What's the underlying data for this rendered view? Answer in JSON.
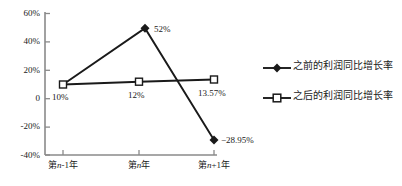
{
  "chart_data": {
    "type": "line",
    "title": "",
    "subtitle": "",
    "xlabel": "",
    "ylabel": "",
    "categories": [
      "第n-1年",
      "第n年",
      "第n+1年"
    ],
    "category_parts": [
      {
        "prefix": "第",
        "italic": "n",
        "suffix": "-1年"
      },
      {
        "prefix": "第",
        "italic": "n",
        "suffix": "年"
      },
      {
        "prefix": "第",
        "italic": "n",
        "suffix": "+1年"
      }
    ],
    "series": [
      {
        "name": "之前的利润同比增长率",
        "marker": "filled-diamond",
        "values": [
          10,
          52,
          -28.95
        ],
        "labels": [
          "10%",
          "52%",
          "−28.95%"
        ]
      },
      {
        "name": "之后的利润同比增长率",
        "marker": "open-square",
        "values": [
          10,
          12,
          13.57
        ],
        "labels": [
          "10%",
          "12%",
          "13.57%"
        ]
      }
    ],
    "ylim": [
      -40,
      60
    ],
    "yticks": [
      60,
      40,
      20,
      0,
      -20,
      -40
    ],
    "ytick_labels": [
      "60%",
      "40%",
      "20%",
      "0",
      "-20%",
      "-40%"
    ],
    "grid": false,
    "legend_position": "right",
    "line_color": "#1a1a1a",
    "axis_color": "#808080"
  },
  "point_labels": {
    "p1": "10%",
    "p2": "12%",
    "p3": "13.57%",
    "peak": "52%",
    "trough": "−28.95%"
  },
  "legend": {
    "items": [
      {
        "label": "之前的利润同比增长率",
        "marker": "filled-diamond"
      },
      {
        "label": "之后的利润同比增长率",
        "marker": "open-square"
      }
    ]
  },
  "yaxis": {
    "t0": "60%",
    "t1": "40%",
    "t2": "20%",
    "t3": "0",
    "t4": "-20%",
    "t5": "-40%"
  }
}
